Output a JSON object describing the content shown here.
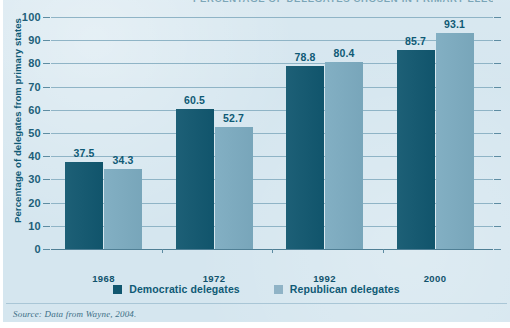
{
  "figure": {
    "title_cropped": "PERCENTAGE OF DELEGATES CHOSEN IN PRIMARY ELECTIONS",
    "source_label": "Source:",
    "source_text": " Data from Wayne, 2004.",
    "colors": {
      "background": "#d5e6ef",
      "democratic": "#11576f",
      "republican": "#7cabc0",
      "grid": "#8fb4c6",
      "text": "#0f5a75"
    }
  },
  "chart_data": {
    "type": "bar",
    "title": "PERCENTAGE OF DELEGATES CHOSEN IN PRIMARY ELECTIONS",
    "xlabel": "",
    "ylabel": "Percentage of delegates from primary states",
    "ylim": [
      0,
      100
    ],
    "ytick_step": 10,
    "yticks": [
      "100",
      "90",
      "80",
      "70",
      "60",
      "50",
      "40",
      "30",
      "20",
      "10",
      "0"
    ],
    "grid": true,
    "legend_position": "bottom-center",
    "categories": [
      "1968",
      "1972",
      "1992",
      "2000"
    ],
    "series": [
      {
        "name": "Democratic delegates",
        "color": "#11576f",
        "values": [
          37.5,
          60.5,
          78.8,
          85.7
        ],
        "labels": [
          "37.5",
          "60.5",
          "78.8",
          "85.7"
        ]
      },
      {
        "name": "Republican delegates",
        "color": "#7cabc0",
        "values": [
          34.3,
          52.7,
          80.4,
          93.1
        ],
        "labels": [
          "34.3",
          "52.7",
          "80.4",
          "93.1"
        ]
      }
    ]
  }
}
